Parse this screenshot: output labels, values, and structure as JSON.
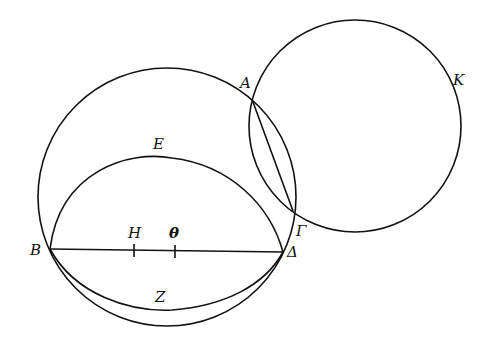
{
  "diagram": {
    "labels": {
      "A": "A",
      "K": "K",
      "E": "E",
      "B": "B",
      "H": "H",
      "Theta": "θ",
      "Gamma": "Γ",
      "Delta": "Δ",
      "Z": "Z"
    },
    "colors": {
      "stroke": "#111111",
      "background": "#ffffff"
    }
  }
}
